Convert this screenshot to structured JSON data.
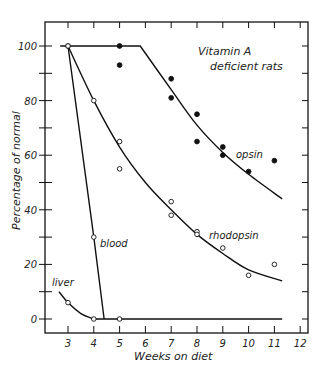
{
  "chart_data": {
    "type": "line",
    "title": "",
    "annotation_title": [
      "Vitamin A",
      "deficient rats"
    ],
    "xlabel": "Weeks on diet",
    "ylabel": "Percentage of normal",
    "xlim": [
      2.1,
      12.3
    ],
    "ylim": [
      -5,
      110
    ],
    "x_ticks": [
      3,
      4,
      5,
      6,
      7,
      8,
      9,
      10,
      11,
      12
    ],
    "y_ticks": [
      0,
      20,
      40,
      60,
      80,
      100
    ],
    "y_tick_labels": [
      "0",
      "20",
      "40",
      "60",
      "80",
      "100"
    ],
    "grid": false,
    "legend": "none (inline curve labels)",
    "series": [
      {
        "name": "opsin",
        "marker": "filled-circle",
        "points": [
          [
            5,
            100
          ],
          [
            5,
            93
          ],
          [
            7,
            88
          ],
          [
            7,
            81
          ],
          [
            8,
            75
          ],
          [
            8,
            65
          ],
          [
            9,
            63
          ],
          [
            9,
            60
          ],
          [
            10,
            54
          ],
          [
            11,
            58
          ]
        ],
        "curve": [
          [
            2.7,
            100
          ],
          [
            5.8,
            100
          ],
          [
            7,
            84
          ],
          [
            8,
            71
          ],
          [
            9,
            61
          ],
          [
            10,
            53
          ],
          [
            11.3,
            44
          ]
        ]
      },
      {
        "name": "rhodopsin",
        "marker": "open-circle",
        "points": [
          [
            3,
            100
          ],
          [
            4,
            80
          ],
          [
            5,
            65
          ],
          [
            5,
            55
          ],
          [
            7,
            43
          ],
          [
            7,
            38
          ],
          [
            8,
            32
          ],
          [
            8,
            31
          ],
          [
            9,
            26
          ],
          [
            10,
            16
          ],
          [
            11,
            20
          ]
        ],
        "curve": [
          [
            3,
            100
          ],
          [
            4,
            80
          ],
          [
            5,
            63
          ],
          [
            6,
            50
          ],
          [
            7,
            40
          ],
          [
            8,
            31
          ],
          [
            9,
            24
          ],
          [
            10,
            18
          ],
          [
            11.3,
            14
          ]
        ]
      },
      {
        "name": "blood",
        "marker": "open-circle",
        "points": [
          [
            3,
            100
          ],
          [
            4,
            30
          ]
        ],
        "curve": [
          [
            3,
            100
          ],
          [
            4,
            30
          ],
          [
            4.4,
            0
          ]
        ]
      },
      {
        "name": "liver",
        "marker": "open-circle",
        "points": [
          [
            3,
            6
          ],
          [
            4,
            0
          ],
          [
            5,
            0
          ]
        ],
        "curve": [
          [
            2.65,
            10
          ],
          [
            3,
            6
          ],
          [
            3.5,
            2
          ],
          [
            4,
            0
          ],
          [
            11.3,
            0
          ]
        ]
      }
    ]
  },
  "labels": {
    "vitamin_a": "Vitamin A",
    "deficient_rats": "deficient rats",
    "opsin": "opsin",
    "rhodopsin": "rhodopsin",
    "blood": "blood",
    "liver": "liver",
    "xlabel": "Weeks on diet",
    "ylabel": "Percentage of normal"
  },
  "colors": {
    "ink": "#111111",
    "background": "#ffffff"
  }
}
